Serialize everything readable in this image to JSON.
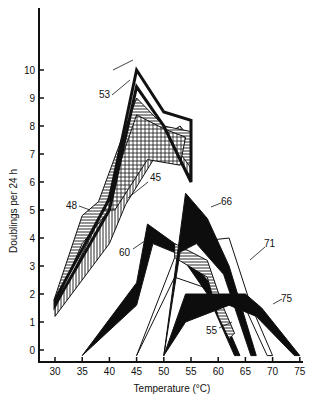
{
  "chart_data": {
    "type": "area",
    "title": "",
    "xlabel": "Temperature (°C)",
    "ylabel": "Doublings per 24 h",
    "xlim": [
      28,
      76
    ],
    "ylim": [
      -0.5,
      12
    ],
    "x_ticks": [
      30,
      35,
      40,
      45,
      50,
      55,
      60,
      65,
      70,
      75
    ],
    "y_ticks": [
      0,
      1,
      2,
      3,
      4,
      5,
      6,
      7,
      8,
      9,
      10
    ],
    "grid": false,
    "legend": "curve numbers labeled directly on bands",
    "series": [
      {
        "name": "45",
        "style": "vertical-hatch",
        "upper": [
          [
            30,
            1.5
          ],
          [
            38,
            4.6
          ],
          [
            45,
            7.0
          ],
          [
            53,
            8.0
          ],
          [
            55,
            7.5
          ]
        ],
        "lower": [
          [
            30,
            1.2
          ],
          [
            40,
            3.8
          ],
          [
            43,
            5.2
          ],
          [
            50,
            7.4
          ],
          [
            55,
            6.2
          ]
        ]
      },
      {
        "name": "48",
        "style": "horizontal-hatch",
        "upper": [
          [
            30,
            1.9
          ],
          [
            35,
            4.8
          ],
          [
            38,
            5.3
          ],
          [
            45,
            9.0
          ],
          [
            50,
            8.0
          ],
          [
            55,
            7.8
          ]
        ],
        "lower": [
          [
            30,
            1.6
          ],
          [
            35,
            3.8
          ],
          [
            40,
            5.0
          ],
          [
            45,
            8.3
          ],
          [
            50,
            7.8
          ],
          [
            55,
            6.5
          ]
        ]
      },
      {
        "name": "53",
        "style": "black-outline",
        "upper": [
          [
            30,
            1.8
          ],
          [
            40,
            5.4
          ],
          [
            45,
            10.0
          ],
          [
            50,
            8.5
          ],
          [
            55,
            8.2
          ]
        ],
        "lower": [
          [
            30,
            1.6
          ],
          [
            40,
            5.0
          ],
          [
            45,
            9.4
          ],
          [
            50,
            8.0
          ],
          [
            55,
            6.0
          ]
        ]
      },
      {
        "name": "60",
        "style": "solid",
        "upper": [
          [
            35,
            -0.2
          ],
          [
            45,
            2.4
          ],
          [
            47,
            4.5
          ],
          [
            52,
            3.8
          ],
          [
            58,
            2.5
          ],
          [
            64,
            -0.2
          ]
        ],
        "lower": [
          [
            35,
            -0.2
          ],
          [
            45,
            1.6
          ],
          [
            48,
            3.8
          ],
          [
            53,
            3.4
          ],
          [
            58,
            2.0
          ],
          [
            63,
            -0.2
          ]
        ]
      },
      {
        "name": "66",
        "style": "solid",
        "upper": [
          [
            50,
            -0.2
          ],
          [
            54,
            5.6
          ],
          [
            58,
            4.7
          ],
          [
            62,
            3.0
          ],
          [
            67,
            -0.2
          ]
        ],
        "lower": [
          [
            50,
            -0.2
          ],
          [
            53,
            3.5
          ],
          [
            56,
            3.8
          ],
          [
            61,
            2.7
          ],
          [
            66,
            -0.2
          ]
        ]
      },
      {
        "name": "71",
        "style": "outline",
        "upper": [
          [
            45,
            -0.2
          ],
          [
            53,
            3.8
          ],
          [
            62,
            4.0
          ],
          [
            66,
            1.6
          ],
          [
            70,
            -0.2
          ]
        ],
        "lower": [
          [
            45,
            -0.2
          ],
          [
            52,
            2.6
          ],
          [
            58,
            2.2
          ],
          [
            65,
            1.5
          ],
          [
            69,
            -0.2
          ]
        ]
      },
      {
        "name": "75",
        "style": "solid",
        "upper": [
          [
            50,
            -0.2
          ],
          [
            54,
            2.0
          ],
          [
            65,
            2.0
          ],
          [
            68,
            1.5
          ],
          [
            75,
            -0.2
          ]
        ],
        "lower": [
          [
            50,
            -0.2
          ],
          [
            54,
            1.0
          ],
          [
            62,
            1.6
          ],
          [
            67,
            1.2
          ],
          [
            74,
            -0.2
          ]
        ]
      },
      {
        "name": "55",
        "style": "horizontal-hatch",
        "upper": [
          [
            52,
            3.8
          ],
          [
            58,
            3.2
          ],
          [
            61,
            1.5
          ],
          [
            63,
            0.6
          ]
        ],
        "lower": [
          [
            52,
            3.3
          ],
          [
            58,
            2.6
          ],
          [
            60,
            1.2
          ],
          [
            62,
            0.4
          ]
        ]
      }
    ]
  },
  "axes": {
    "xlabel": "Temperature (°C)",
    "ylabel": "Doublings per 24 h",
    "x_tick_labels": [
      "30",
      "35",
      "40",
      "45",
      "50",
      "55",
      "60",
      "65",
      "70",
      "75"
    ],
    "y_tick_labels": [
      "0",
      "1",
      "2",
      "3",
      "4",
      "5",
      "6",
      "7",
      "8",
      "9",
      "10"
    ]
  },
  "labels": {
    "l53": "53",
    "l48": "48",
    "l45": "45",
    "l60": "60",
    "l66": "66",
    "l71": "71",
    "l75": "75",
    "l55": "55"
  }
}
